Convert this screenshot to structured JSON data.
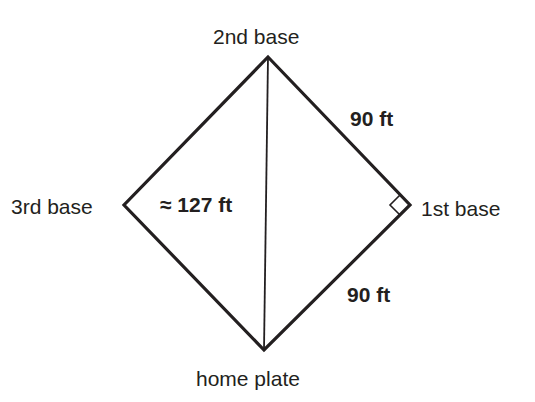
{
  "diagram": {
    "type": "baseball-diamond",
    "vertices": {
      "top": {
        "label": "2nd base"
      },
      "right": {
        "label": "1st base"
      },
      "bottom": {
        "label": "home plate"
      },
      "left": {
        "label": "3rd base"
      }
    },
    "measurements": {
      "upper_right_side": "90 ft",
      "lower_right_side": "90 ft",
      "diagonal": "≈ 127 ft"
    },
    "right_angle_at": "1st base",
    "colors": {
      "line": "#231f20",
      "text": "#231f20",
      "background": "#ffffff"
    }
  }
}
